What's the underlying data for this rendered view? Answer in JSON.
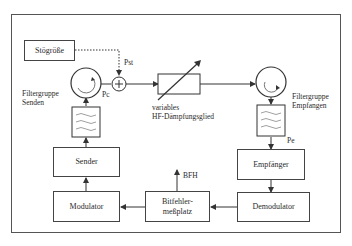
{
  "diagram": {
    "blocks": {
      "stoergroesse": "Stögröße",
      "sender": "Sender",
      "modulator": "Modulator",
      "empfaenger": "Empfänger",
      "demodulator": "Demodulator",
      "bitfehler_line1": "Bitfehler-",
      "bitfehler_line2": "meßplatz"
    },
    "labels": {
      "pst": "Pst",
      "pc": "Pc",
      "pe": "Pe",
      "bfh": "BFH",
      "filter_senden_line1": "Filtergruppe",
      "filter_senden_line2": "Senden",
      "filter_empfangen_line1": "Filtergruppe",
      "filter_empfangen_line2": "Empfangen",
      "daempfung_line1": "variables",
      "daempfung_line2": "HF-Dämpfungsglied"
    },
    "symbols": {
      "adder": "+"
    }
  }
}
